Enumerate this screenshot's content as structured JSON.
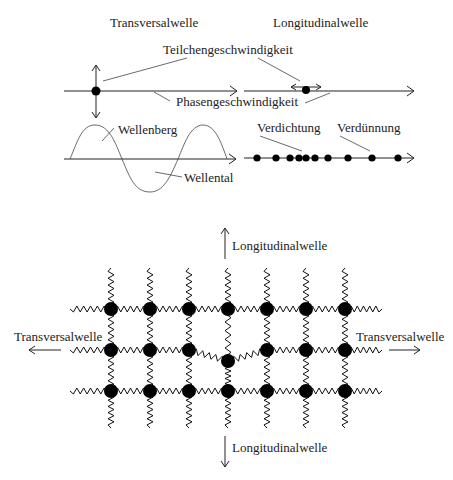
{
  "top": {
    "transversal_title": "Transversalwelle",
    "longitudinal_title": "Longitudinalwelle",
    "particle_velocity": "Teilchengeschwindigkeit",
    "phase_velocity": "Phasengeschwindigkeit",
    "crest": "Wellenberg",
    "trough": "Wellental",
    "compression": "Verdichtung",
    "rarefaction": "Verdünnung"
  },
  "lattice": {
    "top_label": "Longitudinalwelle",
    "bottom_label": "Longitudinalwelle",
    "left_label": "Transversalwelle",
    "right_label": "Transversalwelle",
    "columns": 7,
    "rows": 3,
    "displaced_node": {
      "row": 2,
      "col": 4
    }
  },
  "compression_dots_x": [
    257,
    276,
    290,
    299,
    306,
    315,
    328,
    348,
    372,
    398
  ]
}
